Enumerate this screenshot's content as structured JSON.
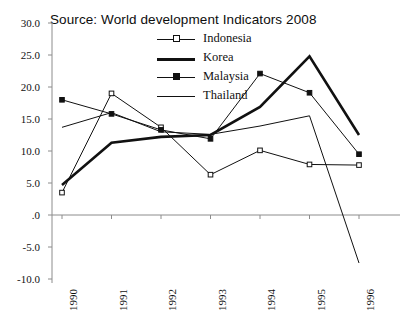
{
  "title": "Source:  World development Indicators 2008",
  "legend": {
    "position": "inside-top-center",
    "entries": [
      {
        "label": "Indonesia",
        "style": "thin-line",
        "marker": "open-square"
      },
      {
        "label": "Korea",
        "style": "thick-line",
        "marker": "none"
      },
      {
        "label": "Malaysia",
        "style": "thin-line",
        "marker": "filled-square"
      },
      {
        "label": "Thailand",
        "style": "thin-line",
        "marker": "none"
      }
    ]
  },
  "axes": {
    "y_ticks": [
      "30.0",
      "25.0",
      "20.0",
      "15.0",
      "10.0",
      "5.0",
      ".0",
      "-5.0",
      "-10.0"
    ],
    "y_values": [
      30,
      25,
      20,
      15,
      10,
      5,
      0,
      -5,
      -10
    ],
    "x_ticks": [
      "1990",
      "1991",
      "1992",
      "1993",
      "1994",
      "1995",
      "1996"
    ]
  },
  "colors": {
    "line": "#111111",
    "axis": "#8c8c8c",
    "background": "#ffffff",
    "text": "#111111"
  },
  "chart_data": {
    "type": "line",
    "title": "Source:  World development Indicators 2008",
    "xlabel": "",
    "ylabel": "",
    "categories": [
      "1990",
      "1991",
      "1992",
      "1993",
      "1994",
      "1995",
      "1996"
    ],
    "x": [
      1990,
      1991,
      1992,
      1993,
      1994,
      1995,
      1996
    ],
    "ylim": [
      -10,
      30
    ],
    "yticks": [
      -10,
      -5,
      0,
      5,
      10,
      15,
      20,
      25,
      30
    ],
    "grid": false,
    "legend_position": "inside-top-center",
    "series": [
      {
        "name": "Indonesia",
        "marker": "open-square",
        "linewidth": "thin",
        "values": [
          3.5,
          19.0,
          13.7,
          6.3,
          10.1,
          7.9,
          7.8
        ]
      },
      {
        "name": "Korea",
        "marker": "none",
        "linewidth": "thick",
        "values": [
          4.7,
          11.3,
          12.2,
          12.5,
          16.9,
          24.8,
          12.5
        ]
      },
      {
        "name": "Malaysia",
        "marker": "filled-square",
        "linewidth": "thin",
        "values": [
          18.0,
          15.8,
          13.3,
          11.9,
          22.1,
          19.1,
          9.5
        ]
      },
      {
        "name": "Thailand",
        "marker": "none",
        "linewidth": "thin",
        "values": [
          13.7,
          16.0,
          13.0,
          12.6,
          13.9,
          15.5,
          -7.5
        ]
      }
    ]
  }
}
